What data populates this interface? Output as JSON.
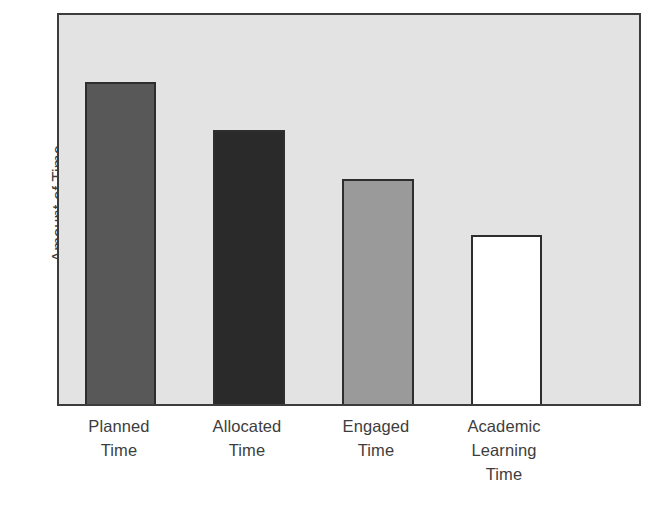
{
  "figure": {
    "title_fragment": "· ·",
    "y_axis_label": "Amount of Time",
    "plot_bg_color": "#e3e3e3",
    "frame_color": "#3c3c3c"
  },
  "chart_data": {
    "type": "bar",
    "title": "",
    "xlabel": "",
    "ylabel": "Amount of Time",
    "categories": [
      "Planned\nTime",
      "Allocated\nTime",
      "Engaged\nTime",
      "Academic\nLearning\nTime"
    ],
    "category_names": [
      "Planned Time",
      "Allocated Time",
      "Engaged Time",
      "Academic Learning Time"
    ],
    "values": [
      82,
      70,
      57,
      43
    ],
    "ylim": [
      0,
      100
    ],
    "grid": false,
    "legend": "none",
    "bar_colors": [
      "#585858",
      "#2a2a2a",
      "#9a9a9a",
      "#ffffff"
    ],
    "bar_edge_color": "#2e2e2e",
    "axis_tick_labels": [],
    "annotations": []
  },
  "bars": [
    {
      "label": "Planned Time",
      "left": 26,
      "width": 71,
      "height": 322,
      "fill": "#585858"
    },
    {
      "label": "Allocated Time",
      "left": 154,
      "width": 72,
      "height": 274,
      "fill": "#2a2a2a"
    },
    {
      "label": "Engaged Time",
      "left": 283,
      "width": 72,
      "height": 225,
      "fill": "#9a9a9a"
    },
    {
      "label": "Academic Learning Time",
      "left": 412,
      "width": 71,
      "height": 169,
      "fill": "#ffffff"
    }
  ],
  "x_labels": [
    {
      "text": "Planned\nTime",
      "left": 2,
      "width": 120
    },
    {
      "text": "Allocated\nTime",
      "left": 130,
      "width": 120
    },
    {
      "text": "Engaged\nTime",
      "left": 259,
      "width": 120
    },
    {
      "text": "Academic\nLearning\nTime",
      "left": 387,
      "width": 120
    }
  ]
}
